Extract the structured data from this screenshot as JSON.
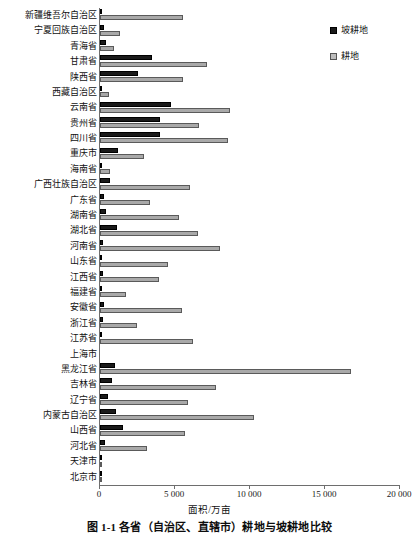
{
  "chart_data": {
    "type": "bar",
    "orientation": "horizontal",
    "title": "图 1-1  各省（自治区、直辖市）耕地与坡耕地比较",
    "xlabel": "面积/万亩",
    "ylabel": "",
    "xlim": [
      0,
      20000
    ],
    "xticks": [
      0,
      5000,
      10000,
      15000,
      20000
    ],
    "xtick_labels": [
      "0",
      "5 000",
      "10 000",
      "15 000",
      "20 000"
    ],
    "grid": false,
    "legend_position": "right-top",
    "categories": [
      "新疆维吾尔自治区",
      "宁夏回族自治区",
      "青海省",
      "甘肃省",
      "陕西省",
      "西藏自治区",
      "云南省",
      "贵州省",
      "四川省",
      "重庆市",
      "海南省",
      "广西壮族自治区",
      "广东省",
      "湖南省",
      "湖北省",
      "河南省",
      "山东省",
      "江西省",
      "福建省",
      "安徽省",
      "浙江省",
      "江苏省",
      "上海市",
      "黑龙江省",
      "吉林省",
      "辽宁省",
      "内蒙古自治区",
      "山西省",
      "河北省",
      "天津市",
      "北京市"
    ],
    "series": [
      {
        "name": "坡耕地",
        "color": "#1a1a1a",
        "values": [
          150,
          250,
          400,
          3470,
          2530,
          120,
          4730,
          4000,
          4030,
          1200,
          80,
          670,
          270,
          420,
          1130,
          200,
          160,
          200,
          130,
          240,
          230,
          70,
          0,
          1000,
          800,
          530,
          1070,
          1530,
          330,
          40,
          40
        ]
      },
      {
        "name": "耕地",
        "color": "#a9a9a9",
        "values": [
          5530,
          1330,
          930,
          7130,
          5530,
          600,
          8670,
          6600,
          8530,
          2930,
          670,
          6000,
          3330,
          5270,
          6530,
          8000,
          4530,
          3930,
          1730,
          5470,
          2470,
          6200,
          0,
          16730,
          7730,
          5870,
          10270,
          5670,
          3130,
          70,
          130
        ]
      }
    ]
  },
  "legend": {
    "items": [
      {
        "label": "坡耕地",
        "swatch": "slope-swatch"
      },
      {
        "label": "耕地",
        "swatch": "crop-swatch"
      }
    ]
  },
  "axis": {
    "x_title": "面积/万亩"
  },
  "caption": {
    "text": "图 1-1  各省（自治区、直辖市）耕地与坡耕地比较"
  }
}
